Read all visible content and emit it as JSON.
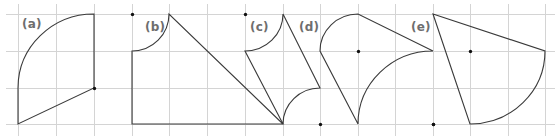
{
  "figure": {
    "grid": {
      "x_lines": [
        18,
        56,
        94,
        132,
        169,
        207,
        245,
        283,
        320,
        358,
        395,
        433,
        470,
        508,
        545
      ],
      "y_lines": [
        14,
        51,
        88,
        124
      ],
      "color": "#d4d4d4"
    },
    "stroke_color": "#3a3a3a",
    "label_color": "#6e6e6e",
    "panels": [
      {
        "id": "a",
        "label": "(a)",
        "label_pos": [
          22,
          18
        ],
        "path": "M 94 14 L 94 88 L 18 124 L 18 88 A 76 74 0 0 1 94 14 Z",
        "dots": [
          [
            94,
            88
          ]
        ]
      },
      {
        "id": "b",
        "label": "(b)",
        "label_pos": [
          145,
          21
        ],
        "path": "M 132 51 A 37 37 0 0 0 169 14 L 283 124 L 132 124 Z",
        "dots": [
          [
            132,
            14
          ]
        ]
      },
      {
        "id": "c",
        "label": "(c)",
        "label_pos": [
          250,
          21
        ],
        "path": "M 245 51 A 38 37 0 0 0 283 14 L 320 88 A 37 36 0 0 0 283 124 Z",
        "dots": [
          [
            245,
            14
          ]
        ]
      },
      {
        "id": "d",
        "label": "(d)",
        "label_pos": [
          299,
          21
        ],
        "path": "M 320 51 A 38 37 0 0 1 358 14 L 433 51 A 75 73 0 0 0 358 124 Z",
        "dots": [
          [
            358,
            51
          ],
          [
            320,
            124
          ],
          [
            433,
            124
          ]
        ]
      },
      {
        "id": "e",
        "label": "(e)",
        "label_pos": [
          411,
          21
        ],
        "path": "M 433 14 L 545 51 A 75 73 0 0 1 470 124 Z",
        "dots": [
          [
            470,
            51
          ],
          [
            433,
            124
          ]
        ]
      }
    ]
  }
}
